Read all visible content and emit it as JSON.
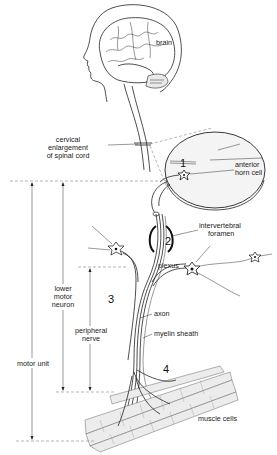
{
  "figure": {
    "labels": {
      "brain": "brain",
      "cervical_line1": "cervical",
      "cervical_line2": "enlargement",
      "cervical_line3": "of spinal cord",
      "anterior_horn_line1": "anterior",
      "anterior_horn_line2": "horn cell",
      "intervertebral_line1": "intervertebral",
      "intervertebral_line2": "foramen",
      "plexus": "plexus",
      "axon": "axon",
      "myelin_sheath": "myelin sheath",
      "muscle_cells": "muscle cells",
      "lower_motor_line1": "lower",
      "lower_motor_line2": "motor",
      "lower_motor_line3": "neuron",
      "peripheral_line1": "peripheral",
      "peripheral_line2": "nerve",
      "motor_unit": "motor unit"
    },
    "numbers": {
      "n1": "1",
      "n2": "2",
      "n3": "3",
      "n4": "4"
    }
  }
}
